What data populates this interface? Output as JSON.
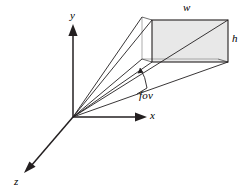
{
  "figure": {
    "background_color": "#ffffff",
    "stroke_color": "#231f20",
    "plane_fill_color": "#e8e8e8"
  },
  "axes": {
    "y": {
      "label": "y",
      "x": 70,
      "y": 10
    },
    "x": {
      "label": "x",
      "x": 150,
      "y": 110
    },
    "z": {
      "label": "z",
      "x": 14,
      "y": 176
    }
  },
  "image_plane": {
    "width_label": "w",
    "height_label": "h",
    "width_label_pos": {
      "x": 183,
      "y": 2
    },
    "height_label_pos": {
      "x": 232,
      "y": 33
    }
  },
  "angle": {
    "label": "fov",
    "label_pos": {
      "x": 139,
      "y": 90
    }
  },
  "geometry": {
    "origin": {
      "x": 73,
      "y": 117
    },
    "front_rect": {
      "left": 152,
      "top": 20,
      "right": 228,
      "bottom": 62
    },
    "back_rect": {
      "left": 142,
      "top": 17,
      "right": 218,
      "bottom": 59
    }
  }
}
